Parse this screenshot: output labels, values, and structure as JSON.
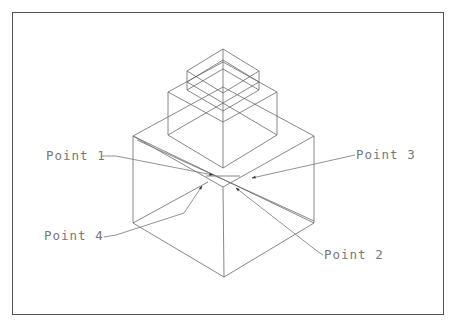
{
  "diagram": {
    "type": "isometric-line-drawing",
    "labels": [
      {
        "id": "p1",
        "text": "Point 1"
      },
      {
        "id": "p2",
        "text": "Point 2"
      },
      {
        "id": "p3",
        "text": "Point 3"
      },
      {
        "id": "p4",
        "text": "Point 4"
      }
    ],
    "colors": {
      "line": "#6a6a6a",
      "frame": "#555555",
      "text": "#777777",
      "background": "#ffffff"
    }
  }
}
